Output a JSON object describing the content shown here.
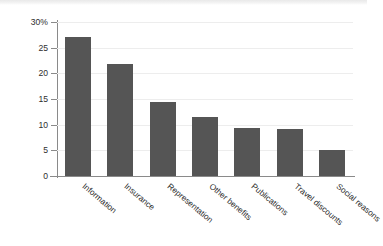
{
  "chart_data": {
    "type": "bar",
    "title": "",
    "xlabel": "",
    "ylabel": "PERCENTAGE",
    "ylim": [
      0,
      30
    ],
    "grid": true,
    "legend": "none",
    "y_ticks": [
      "0",
      "5",
      "10",
      "15",
      "20",
      "25",
      "30%"
    ],
    "y_tick_values": [
      0,
      5,
      10,
      15,
      20,
      25,
      30
    ],
    "categories": [
      "Information",
      "Insurance",
      "Representation",
      "Other benefits",
      "Publications",
      "Travel discounts",
      "Social reasons"
    ],
    "values": [
      27.0,
      21.8,
      14.5,
      11.4,
      9.3,
      9.1,
      5.0
    ],
    "bar_color": "#555555",
    "gridline_color": "#ededed",
    "axis_color": "#8a8a8a"
  }
}
